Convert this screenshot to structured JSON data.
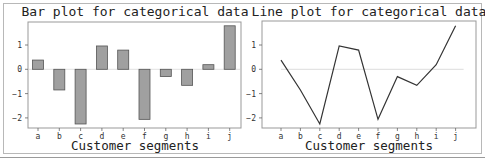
{
  "chart_data": [
    {
      "type": "bar",
      "title": "Bar plot for categorical data",
      "xlabel": "Customer segments",
      "ylabel": "",
      "categories": [
        "a",
        "b",
        "c",
        "d",
        "e",
        "f",
        "g",
        "h",
        "i",
        "j"
      ],
      "values": [
        0.38,
        -0.85,
        -2.25,
        0.96,
        0.79,
        -2.06,
        -0.3,
        -0.66,
        0.19,
        1.79
      ],
      "yticks": [
        1,
        0,
        -1,
        -2
      ],
      "ytick_labels": [
        "1",
        "0",
        "−1",
        "−2"
      ],
      "ylim": [
        -2.45,
        1.95
      ],
      "grid": false,
      "bar_color": "#a0a0a0",
      "edge_color": "#555555"
    },
    {
      "type": "line",
      "title": "Line plot for categorical data",
      "xlabel": "Customer segments",
      "ylabel": "",
      "categories": [
        "a",
        "b",
        "c",
        "d",
        "e",
        "f",
        "g",
        "h",
        "i",
        "j"
      ],
      "values": [
        0.38,
        -0.85,
        -2.25,
        0.96,
        0.79,
        -2.06,
        -0.3,
        -0.66,
        0.19,
        1.79
      ],
      "yticks": [
        1,
        0,
        -1,
        -2
      ],
      "ytick_labels": [
        "1",
        "0",
        "−1",
        "−2"
      ],
      "ylim": [
        -2.45,
        1.95
      ],
      "grid": false,
      "reference_line": 0,
      "line_color": "#333333"
    }
  ]
}
